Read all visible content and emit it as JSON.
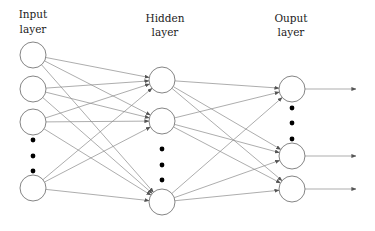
{
  "diagram": {
    "colors": {
      "node_stroke": "#777777",
      "edge": "#8a8a8a",
      "label": "#222222",
      "dot": "#000000",
      "background": "#ffffff"
    },
    "node_radius": 13,
    "layers": [
      {
        "id": "input",
        "label_line1": "Input",
        "label_line2": "layer",
        "label_x": 33,
        "x": 33,
        "nodes_y": [
          55,
          89,
          122,
          188
        ],
        "ellipsis_y": [
          140,
          156,
          171
        ]
      },
      {
        "id": "hidden",
        "label_line1": "Hidden",
        "label_line2": "layer",
        "label_x": 165,
        "x": 162,
        "nodes_y": [
          80,
          121,
          202
        ],
        "ellipsis_y": [
          149,
          165,
          180
        ]
      },
      {
        "id": "output",
        "label_line1": "Ouput",
        "label_line2": "layer",
        "label_x": 291,
        "x": 292,
        "nodes_y": [
          89,
          156,
          189
        ],
        "ellipsis_y": [
          108,
          123,
          139
        ]
      }
    ],
    "output_arrow_end_x": 356,
    "connectivity": "fully-connected"
  }
}
